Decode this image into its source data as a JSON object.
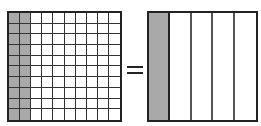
{
  "diagram": {
    "title_fragment": "",
    "left_grid": {
      "rows": 10,
      "columns": 10,
      "shaded_columns": 2,
      "represents": "20/100"
    },
    "operator": "=",
    "right_model": {
      "columns": 5,
      "shaded_columns": 1,
      "represents": "1/5"
    },
    "colors": {
      "shade": "#a9a9a9",
      "line": "#222222",
      "background": "#ffffff"
    }
  }
}
